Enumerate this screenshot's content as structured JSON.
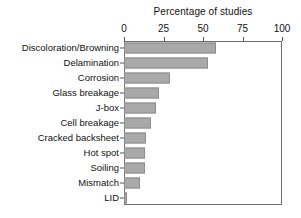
{
  "chart_data": {
    "type": "bar",
    "orientation": "horizontal",
    "title": "",
    "xlabel": "Percentage of studies",
    "ylabel": "",
    "xlim": [
      0,
      100
    ],
    "xticks": [
      0,
      25,
      50,
      75,
      100
    ],
    "grid": false,
    "legend": null,
    "categories": [
      "Discoloration/Browning",
      "Delamination",
      "Corrosion",
      "Glass breakage",
      "J-box",
      "Cell breakage",
      "Cracked backsheet",
      "Hot spot",
      "Soiling",
      "Mismatch",
      "LID"
    ],
    "values": [
      58,
      53,
      29,
      22,
      20,
      17,
      14,
      13,
      13,
      10,
      2
    ],
    "bar_color": "#a9a9a9",
    "bar_edge_color": "#8c8c8c",
    "axis_color": "#6f6f6f"
  }
}
